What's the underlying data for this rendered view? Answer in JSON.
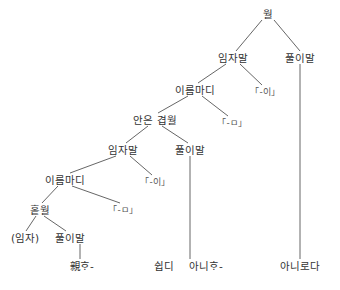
{
  "diagram": {
    "type": "syntax-tree",
    "nodes": {
      "root": "월",
      "subj1": "임자말",
      "pred1": "풀이말",
      "nclause1": "이름마디",
      "marker_i1": "「-이」",
      "complex": "안은 겹월",
      "marker_m1": "「-ㅁ」",
      "subj2": "임자말",
      "pred2": "풀이말",
      "nclause2": "이름마디",
      "marker_i2": "「-이」",
      "simple": "홑월",
      "marker_m2": "「-ㅁ」",
      "subj3": "(임자)",
      "pred3": "풀이말",
      "leaf1": "親ᄒᆞ-",
      "leaf2": "쉽디",
      "leaf3": "아니ᄒᆞ-",
      "leaf4": "아니로다"
    },
    "edges": [
      [
        "root",
        "subj1"
      ],
      [
        "root",
        "pred1"
      ],
      [
        "subj1",
        "nclause1"
      ],
      [
        "subj1",
        "marker_i1"
      ],
      [
        "nclause1",
        "complex"
      ],
      [
        "nclause1",
        "marker_m1"
      ],
      [
        "complex",
        "subj2"
      ],
      [
        "complex",
        "pred2"
      ],
      [
        "subj2",
        "nclause2"
      ],
      [
        "subj2",
        "marker_i2"
      ],
      [
        "nclause2",
        "simple"
      ],
      [
        "nclause2",
        "marker_m2"
      ],
      [
        "simple",
        "subj3"
      ],
      [
        "simple",
        "pred3"
      ],
      [
        "pred3",
        "leaf1"
      ],
      [
        "pred2",
        "leaf3"
      ],
      [
        "pred1",
        "leaf4"
      ]
    ]
  }
}
